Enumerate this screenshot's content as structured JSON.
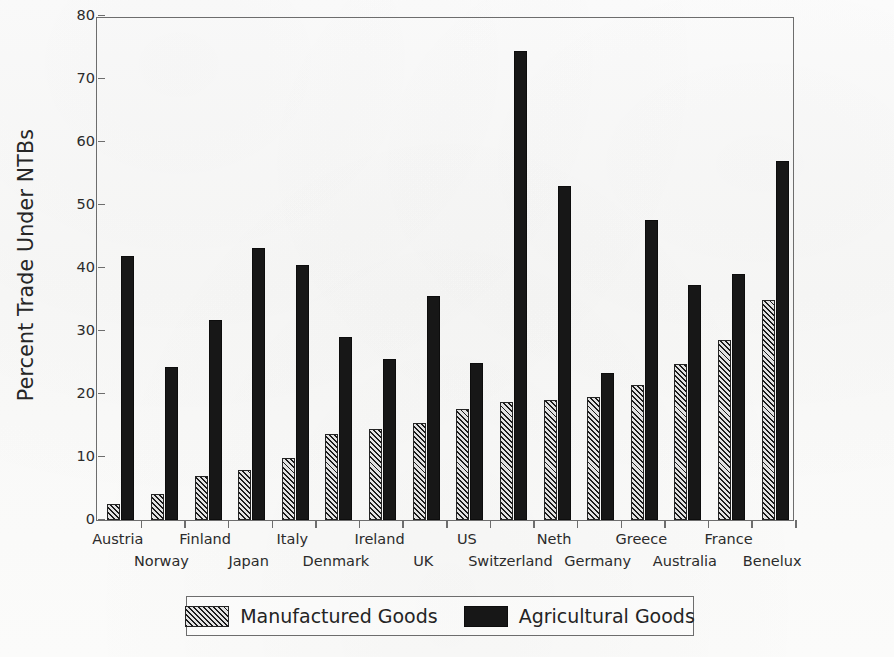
{
  "chart_data": {
    "type": "bar",
    "title": "",
    "xlabel": "",
    "ylabel": "Percent Trade Under NTBs",
    "ylim": [
      0,
      80
    ],
    "yticks": [
      0,
      10,
      20,
      30,
      40,
      50,
      60,
      70,
      80
    ],
    "grid": false,
    "legend_position": "bottom",
    "categories": [
      "Austria",
      "Norway",
      "Finland",
      "Japan",
      "Italy",
      "Denmark",
      "Ireland",
      "UK",
      "US",
      "Switzerland",
      "Neth",
      "Germany",
      "Greece",
      "Australia",
      "France",
      "Benelux"
    ],
    "series": [
      {
        "name": "Manufactured Goods",
        "color": "#8c8c8c",
        "pattern": "diagonal-hatch",
        "values": [
          2.6,
          4.2,
          7.0,
          8.0,
          9.8,
          13.7,
          14.4,
          15.4,
          17.7,
          18.7,
          19.0,
          19.5,
          21.4,
          24.8,
          28.5,
          35.0
        ]
      },
      {
        "name": "Agricultural Goods",
        "color": "#171717",
        "pattern": "solid",
        "values": [
          41.9,
          24.3,
          31.8,
          43.2,
          40.4,
          29.0,
          25.5,
          35.6,
          25.0,
          74.4,
          53.0,
          23.4,
          47.6,
          37.3,
          39.0,
          57.0
        ]
      }
    ]
  },
  "axis": {
    "y_title": "Percent Trade Under NTBs",
    "y_tick_labels": [
      "0",
      "10",
      "20",
      "30",
      "40",
      "50",
      "60",
      "70",
      "80"
    ]
  },
  "legend": {
    "entries": [
      {
        "label": "Manufactured Goods",
        "swatch": "hatched-swatch"
      },
      {
        "label": "Agricultural Goods",
        "swatch": "solid-black-swatch"
      }
    ]
  }
}
